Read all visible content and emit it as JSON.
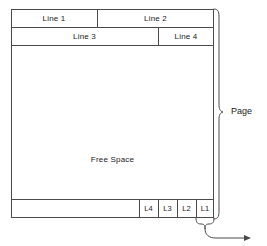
{
  "diagram": {
    "rows": {
      "row1": [
        {
          "label": "Line 1"
        },
        {
          "label": "Line 2"
        }
      ],
      "row2": [
        {
          "label": "Line 3"
        },
        {
          "label": "Line 4"
        }
      ],
      "free_space": {
        "label": "Free Space"
      },
      "row_bottom": [
        {
          "label": "L4"
        },
        {
          "label": "L3"
        },
        {
          "label": "L2"
        },
        {
          "label": "L1"
        }
      ]
    },
    "annotations": {
      "page_brace_label": "Page"
    },
    "colors": {
      "stroke": "#4a4a4a",
      "text": "#1a1a1a",
      "background": "#ffffff"
    }
  }
}
